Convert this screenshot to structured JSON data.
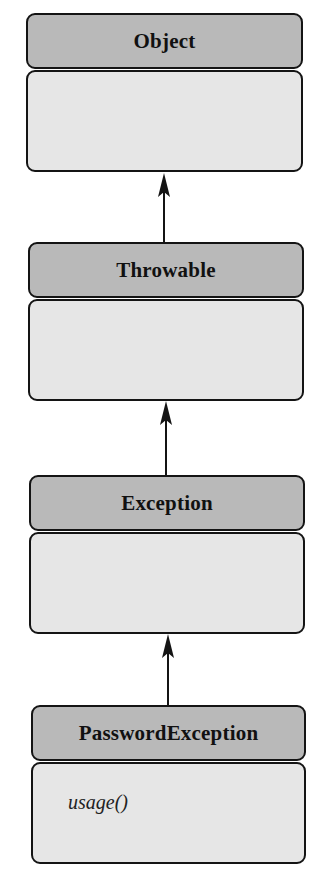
{
  "diagram": {
    "type": "UML class hierarchy",
    "colors": {
      "header": "#b9b9b9",
      "body": "#e6e6e6",
      "border": "#141414",
      "background": "#ffffff"
    },
    "classes": [
      {
        "name": "Object",
        "methods": []
      },
      {
        "name": "Throwable",
        "methods": []
      },
      {
        "name": "Exception",
        "methods": []
      },
      {
        "name": "PasswordException",
        "methods": [
          "usage()"
        ]
      }
    ],
    "relations": [
      {
        "from": "Throwable",
        "to": "Object",
        "type": "inheritance-arrow"
      },
      {
        "from": "Exception",
        "to": "Throwable",
        "type": "inheritance-arrow"
      },
      {
        "from": "PasswordException",
        "to": "Exception",
        "type": "inheritance-arrow"
      }
    ]
  }
}
